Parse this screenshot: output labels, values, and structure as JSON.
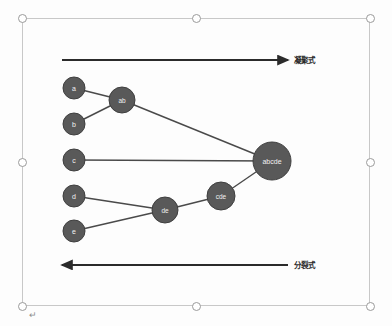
{
  "editor": {
    "object_selected": true,
    "paragraph_mark": "↵",
    "canvas_background": "#fdfdfd",
    "selection_border_color": "#c8c8c8",
    "handle_fill": "#ffffff",
    "handle_border": "#9a9a9a"
  },
  "diagram": {
    "title": "",
    "type": "hierarchical-clustering-dendrogram",
    "node_fill": "#595959",
    "node_stroke": "#3f3f3f",
    "node_text_color": "#f2f2f2",
    "link_color": "#4a4a4a",
    "arrow_color": "#2b2b2b",
    "nodes": [
      {
        "id": "a",
        "label": "a",
        "x": 74,
        "y": 88,
        "r": 11
      },
      {
        "id": "b",
        "label": "b",
        "x": 74,
        "y": 124,
        "r": 11
      },
      {
        "id": "c",
        "label": "c",
        "x": 74,
        "y": 160,
        "r": 11
      },
      {
        "id": "d",
        "label": "d",
        "x": 74,
        "y": 196,
        "r": 11
      },
      {
        "id": "e",
        "label": "e",
        "x": 74,
        "y": 231,
        "r": 11
      },
      {
        "id": "ab",
        "label": "ab",
        "x": 122,
        "y": 100,
        "r": 13
      },
      {
        "id": "de",
        "label": "de",
        "x": 165,
        "y": 210,
        "r": 13
      },
      {
        "id": "cde",
        "label": "cde",
        "x": 221,
        "y": 196,
        "r": 14
      },
      {
        "id": "abcde",
        "label": "abcde",
        "x": 272,
        "y": 161,
        "r": 19
      }
    ],
    "links": [
      {
        "from": "a",
        "to": "ab"
      },
      {
        "from": "b",
        "to": "ab"
      },
      {
        "from": "d",
        "to": "de"
      },
      {
        "from": "e",
        "to": "de"
      },
      {
        "from": "de",
        "to": "cde"
      },
      {
        "from": "ab",
        "to": "abcde"
      },
      {
        "from": "c",
        "to": "abcde"
      },
      {
        "from": "cde",
        "to": "abcde"
      }
    ],
    "arrows": [
      {
        "id": "agglomerative",
        "direction": "right",
        "x1": 62,
        "x2": 288,
        "y": 60,
        "label": "凝聚式",
        "label_x": 294,
        "label_y": 54
      },
      {
        "id": "divisive",
        "direction": "left",
        "x1": 62,
        "x2": 288,
        "y": 265,
        "label": "分裂式",
        "label_x": 294,
        "label_y": 259
      }
    ]
  },
  "selection_handles": [
    {
      "name": "handle-top-left",
      "x": 18,
      "y": 14
    },
    {
      "name": "handle-top-center",
      "x": 192,
      "y": 14
    },
    {
      "name": "handle-top-right",
      "x": 366,
      "y": 14
    },
    {
      "name": "handle-middle-left",
      "x": 18,
      "y": 158
    },
    {
      "name": "handle-middle-right",
      "x": 366,
      "y": 158
    },
    {
      "name": "handle-bottom-left",
      "x": 18,
      "y": 302
    },
    {
      "name": "handle-bottom-center",
      "x": 192,
      "y": 302
    },
    {
      "name": "handle-bottom-right",
      "x": 366,
      "y": 302
    }
  ]
}
